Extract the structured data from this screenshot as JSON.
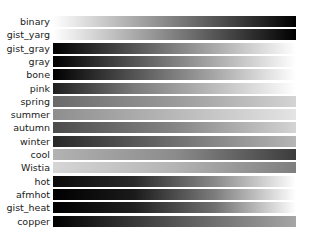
{
  "chart_data": {
    "type": "heatmap",
    "title": "",
    "xlabel": "",
    "ylabel": "",
    "axes_visible": false,
    "categories": [
      "binary",
      "gist_yarg",
      "gist_gray",
      "gray",
      "bone",
      "pink",
      "spring",
      "summer",
      "autumn",
      "winter",
      "cool",
      "Wistia",
      "hot",
      "afmhot",
      "gist_heat",
      "copper"
    ],
    "series": [
      {
        "name": "binary",
        "gradient": [
          "#ffffff",
          "#000000"
        ]
      },
      {
        "name": "gist_yarg",
        "gradient": [
          "#ffffff",
          "#000000"
        ]
      },
      {
        "name": "gist_gray",
        "gradient": [
          "#000000",
          "#ffffff"
        ]
      },
      {
        "name": "gray",
        "gradient": [
          "#000000",
          "#ffffff"
        ]
      },
      {
        "name": "bone",
        "gradient": [
          "#000000",
          "#545454",
          "#a7a7a7",
          "#ffffff"
        ]
      },
      {
        "name": "pink",
        "gradient": [
          "#1e1e1e",
          "#7a7a7a",
          "#bcbcbc",
          "#ffffff"
        ]
      },
      {
        "name": "spring",
        "gradient": [
          "#6a6a6a",
          "#9a9a9a",
          "#d4d4d4"
        ]
      },
      {
        "name": "summer",
        "gradient": [
          "#8e8e8e",
          "#b8b8b8",
          "#e4e4e4"
        ]
      },
      {
        "name": "autumn",
        "gradient": [
          "#4c4c4c",
          "#858585",
          "#d4d4d4"
        ]
      },
      {
        "name": "winter",
        "gradient": [
          "#272727",
          "#6f6f6f",
          "#b6b6b6"
        ]
      },
      {
        "name": "cool",
        "gradient": [
          "#b2b2b2",
          "#8c8c8c",
          "#3c3c3c"
        ]
      },
      {
        "name": "Wistia",
        "gradient": [
          "#d6d6d6",
          "#b4b4b4",
          "#7e7e7e"
        ]
      },
      {
        "name": "hot",
        "gradient": [
          "#0b0b0b",
          "#2a2a2a",
          "#8a8a8a",
          "#ffffff"
        ]
      },
      {
        "name": "afmhot",
        "gradient": [
          "#000000",
          "#1a1a1a",
          "#7d7d7d",
          "#ffffff"
        ]
      },
      {
        "name": "gist_heat",
        "gradient": [
          "#000000",
          "#202020",
          "#707070",
          "#ffffff"
        ]
      },
      {
        "name": "copper",
        "gradient": [
          "#000000",
          "#545454",
          "#a6a6a6"
        ]
      }
    ]
  }
}
